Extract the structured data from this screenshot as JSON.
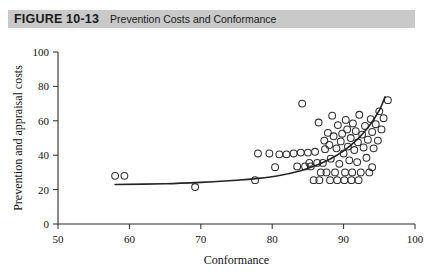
{
  "figure": {
    "label": "FIGURE 10-13",
    "title": "Prevention Costs and Conformance",
    "bar_color": "#c9c9c9"
  },
  "chart_data": {
    "type": "scatter",
    "title": "Prevention Costs and Conformance",
    "xlabel": "Conformance",
    "ylabel": "Prevention and appraisal costs",
    "xlim": [
      50,
      100
    ],
    "ylim": [
      0,
      100
    ],
    "xticks": [
      50,
      60,
      70,
      80,
      90,
      100
    ],
    "yticks": [
      0,
      20,
      40,
      60,
      80,
      100
    ],
    "grid": false,
    "legend": null,
    "marker": "open-circle",
    "marker_color": "#303030",
    "points": [
      {
        "x": 58.0,
        "y": 28.0
      },
      {
        "x": 59.3,
        "y": 28.0
      },
      {
        "x": 69.2,
        "y": 21.5
      },
      {
        "x": 77.6,
        "y": 25.5
      },
      {
        "x": 78.0,
        "y": 41.0
      },
      {
        "x": 79.6,
        "y": 41.0
      },
      {
        "x": 81.0,
        "y": 40.5
      },
      {
        "x": 82.0,
        "y": 40.5
      },
      {
        "x": 83.0,
        "y": 41.0
      },
      {
        "x": 84.0,
        "y": 41.5
      },
      {
        "x": 84.2,
        "y": 70.0
      },
      {
        "x": 85.0,
        "y": 41.5
      },
      {
        "x": 85.2,
        "y": 35.5
      },
      {
        "x": 86.0,
        "y": 42.0
      },
      {
        "x": 86.3,
        "y": 35.5
      },
      {
        "x": 86.5,
        "y": 59.0
      },
      {
        "x": 86.8,
        "y": 30.0
      },
      {
        "x": 87.1,
        "y": 35.5
      },
      {
        "x": 87.3,
        "y": 48.5
      },
      {
        "x": 87.4,
        "y": 43.5
      },
      {
        "x": 87.6,
        "y": 30.0
      },
      {
        "x": 87.8,
        "y": 53.0
      },
      {
        "x": 88.0,
        "y": 46.0
      },
      {
        "x": 88.2,
        "y": 38.0
      },
      {
        "x": 88.4,
        "y": 63.0
      },
      {
        "x": 88.6,
        "y": 51.0
      },
      {
        "x": 88.8,
        "y": 30.0
      },
      {
        "x": 89.0,
        "y": 44.0
      },
      {
        "x": 89.2,
        "y": 57.5
      },
      {
        "x": 89.4,
        "y": 35.0
      },
      {
        "x": 89.6,
        "y": 48.0
      },
      {
        "x": 89.8,
        "y": 52.5
      },
      {
        "x": 90.0,
        "y": 41.0
      },
      {
        "x": 90.2,
        "y": 30.0
      },
      {
        "x": 90.3,
        "y": 60.5
      },
      {
        "x": 90.5,
        "y": 55.0
      },
      {
        "x": 90.6,
        "y": 45.0
      },
      {
        "x": 90.8,
        "y": 37.0
      },
      {
        "x": 91.0,
        "y": 50.0
      },
      {
        "x": 91.2,
        "y": 30.0
      },
      {
        "x": 91.3,
        "y": 58.5
      },
      {
        "x": 91.5,
        "y": 43.0
      },
      {
        "x": 91.7,
        "y": 54.0
      },
      {
        "x": 91.9,
        "y": 36.0
      },
      {
        "x": 92.0,
        "y": 47.5
      },
      {
        "x": 92.2,
        "y": 63.5
      },
      {
        "x": 92.4,
        "y": 30.0
      },
      {
        "x": 92.6,
        "y": 52.0
      },
      {
        "x": 92.8,
        "y": 44.5
      },
      {
        "x": 93.0,
        "y": 57.0
      },
      {
        "x": 93.2,
        "y": 38.5
      },
      {
        "x": 93.4,
        "y": 49.0
      },
      {
        "x": 93.6,
        "y": 30.0
      },
      {
        "x": 93.8,
        "y": 61.0
      },
      {
        "x": 94.0,
        "y": 53.5
      },
      {
        "x": 94.2,
        "y": 44.0
      },
      {
        "x": 94.5,
        "y": 58.0
      },
      {
        "x": 94.8,
        "y": 48.5
      },
      {
        "x": 95.0,
        "y": 65.5
      },
      {
        "x": 95.3,
        "y": 55.0
      },
      {
        "x": 95.6,
        "y": 61.5
      },
      {
        "x": 96.2,
        "y": 72.0
      },
      {
        "x": 85.8,
        "y": 25.5
      },
      {
        "x": 86.6,
        "y": 25.5
      },
      {
        "x": 88.1,
        "y": 25.5
      },
      {
        "x": 89.1,
        "y": 25.5
      },
      {
        "x": 90.1,
        "y": 25.5
      },
      {
        "x": 91.1,
        "y": 25.5
      },
      {
        "x": 92.1,
        "y": 25.5
      },
      {
        "x": 80.4,
        "y": 33.0
      },
      {
        "x": 83.5,
        "y": 33.5
      },
      {
        "x": 84.6,
        "y": 33.5
      },
      {
        "x": 85.4,
        "y": 33.5
      },
      {
        "x": 94.0,
        "y": 33.0
      }
    ],
    "fit_curve": {
      "name": "exponential trend",
      "x_start": 58.0,
      "x_end": 95.8,
      "points": [
        {
          "x": 58.0,
          "y": 23.0
        },
        {
          "x": 65.0,
          "y": 23.4
        },
        {
          "x": 70.0,
          "y": 24.2
        },
        {
          "x": 75.0,
          "y": 25.4
        },
        {
          "x": 78.0,
          "y": 26.5
        },
        {
          "x": 81.0,
          "y": 28.2
        },
        {
          "x": 84.0,
          "y": 31.0
        },
        {
          "x": 86.0,
          "y": 33.8
        },
        {
          "x": 88.0,
          "y": 37.5
        },
        {
          "x": 90.0,
          "y": 42.5
        },
        {
          "x": 92.0,
          "y": 49.5
        },
        {
          "x": 93.5,
          "y": 56.5
        },
        {
          "x": 95.0,
          "y": 66.0
        },
        {
          "x": 95.8,
          "y": 74.0
        }
      ]
    }
  }
}
